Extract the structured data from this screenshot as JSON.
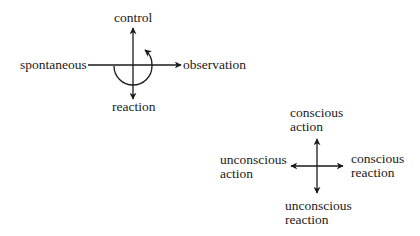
{
  "diagram_1": {
    "title": "Interaction axes",
    "top_label": "control",
    "bottom_label": "reaction",
    "left_label": "spontaneous",
    "right_label": "observation",
    "rotation_arrow": "counterclockwise-curved-arrow"
  },
  "diagram_2": {
    "title": "Consciousness quadrants",
    "top_label": [
      "conscious",
      "action"
    ],
    "left_label": [
      "unconscious",
      "action"
    ],
    "right_label": [
      "conscious",
      "reaction"
    ],
    "bottom_label": [
      "unconscious",
      "reaction"
    ]
  },
  "colors": {
    "ink": "#1a1a1a",
    "background": "#ffffff"
  }
}
